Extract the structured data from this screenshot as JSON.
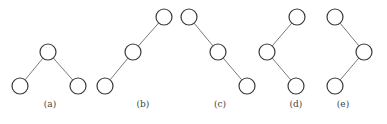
{
  "figure": {
    "node_radius": 8,
    "colors": {
      "node_stroke": "#3a3a3a",
      "edge": "#7a7a7a",
      "node_fill": "#ffffff",
      "caption": "#444444"
    },
    "trees": [
      {
        "id": "a",
        "caption": "(a)",
        "caption_pos": [
          50,
          107
        ],
        "nodes": [
          [
            48,
            52
          ],
          [
            20,
            86
          ],
          [
            78,
            86
          ]
        ],
        "edges": [
          [
            0,
            1
          ],
          [
            0,
            2
          ]
        ]
      },
      {
        "id": "b",
        "caption": "(b)",
        "caption_pos": [
          143,
          107
        ],
        "nodes": [
          [
            164,
            17
          ],
          [
            133,
            52
          ],
          [
            105,
            86
          ]
        ],
        "edges": [
          [
            0,
            1
          ],
          [
            1,
            2
          ]
        ]
      },
      {
        "id": "c",
        "caption": "(c)",
        "caption_pos": [
          220,
          107
        ],
        "nodes": [
          [
            189,
            17
          ],
          [
            218,
            52
          ],
          [
            247,
            86
          ]
        ],
        "edges": [
          [
            0,
            1
          ],
          [
            1,
            2
          ]
        ]
      },
      {
        "id": "d",
        "caption": "(d)",
        "caption_pos": [
          296,
          107
        ],
        "nodes": [
          [
            297,
            17
          ],
          [
            267,
            52
          ],
          [
            296,
            86
          ]
        ],
        "edges": [
          [
            0,
            1
          ],
          [
            1,
            2
          ]
        ]
      },
      {
        "id": "e",
        "caption": "(e)",
        "caption_pos": [
          343,
          107
        ],
        "nodes": [
          [
            335,
            17
          ],
          [
            364,
            52
          ],
          [
            335,
            86
          ]
        ],
        "edges": [
          [
            0,
            1
          ],
          [
            1,
            2
          ]
        ]
      }
    ]
  }
}
